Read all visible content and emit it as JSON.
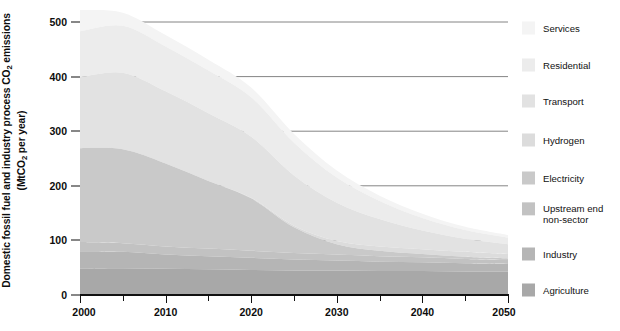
{
  "chart_data": {
    "type": "area",
    "stacked": true,
    "title": "",
    "xlabel": "",
    "ylabel": "Domestic fossil fuel and industry process CO2 emissions (MtCO2 per year)",
    "ylabel_line1": "Domestic fossil fuel and industry process CO",
    "ylabel_line1_sub": "2",
    "ylabel_line1_tail": " emissions",
    "ylabel_line2_head": "(MtCO",
    "ylabel_line2_sub": "2",
    "ylabel_line2_tail": " per year)",
    "xlim": [
      2000,
      2050
    ],
    "ylim": [
      0,
      500
    ],
    "yticks": [
      0,
      100,
      200,
      300,
      400,
      500
    ],
    "ytick_labels": [
      "0",
      "100",
      "200",
      "300",
      "400",
      "500"
    ],
    "xticks": [
      2000,
      2010,
      2020,
      2030,
      2040,
      2050
    ],
    "xtick_labels": [
      "2000",
      "2010",
      "2020",
      "2030",
      "2040",
      "2050"
    ],
    "xminor_ticks": [
      2005,
      2015,
      2025,
      2035,
      2045
    ],
    "grid": "horizontal-behind-area",
    "legend_position": "right",
    "x": [
      2000,
      2005,
      2010,
      2015,
      2020,
      2025,
      2030,
      2035,
      2040,
      2045,
      2050
    ],
    "series": [
      {
        "name": "Agriculture",
        "color": "#a8a8a8",
        "values": [
          48,
          49,
          48,
          47,
          46,
          45,
          45,
          44,
          44,
          43,
          43
        ]
      },
      {
        "name": "Industry",
        "color": "#b5b5b5",
        "values": [
          32,
          30,
          26,
          24,
          22,
          20,
          18,
          17,
          16,
          15,
          14
        ]
      },
      {
        "name": "Upstream end non-sector",
        "color": "#c2c2c2",
        "values": [
          17,
          16,
          15,
          14,
          13,
          12,
          11,
          10,
          9,
          8,
          7
        ]
      },
      {
        "name": "Electricity",
        "color": "#c9c9c9",
        "values": [
          172,
          172,
          152,
          124,
          96,
          47,
          19,
          10,
          6,
          4,
          3
        ]
      },
      {
        "name": "Hydrogen",
        "color": "#dcdcdc",
        "values": [
          0,
          0,
          0,
          0,
          1,
          3,
          6,
          8,
          9,
          9,
          8
        ]
      },
      {
        "name": "Transport",
        "color": "#e2e2e2",
        "values": [
          130,
          140,
          132,
          124,
          112,
          92,
          70,
          50,
          34,
          24,
          18
        ]
      },
      {
        "name": "Residential",
        "color": "#ececec",
        "values": [
          84,
          86,
          82,
          78,
          72,
          60,
          46,
          33,
          23,
          16,
          12
        ]
      },
      {
        "name": "Services",
        "color": "#f4f4f4",
        "values": [
          39,
          24,
          21,
          20,
          18,
          16,
          13,
          10,
          8,
          6,
          5
        ]
      }
    ],
    "totals": [
      522,
      517,
      476,
      431,
      380,
      295,
      228,
      182,
      149,
      125,
      110
    ]
  },
  "legend": {
    "items": [
      {
        "label": "Services",
        "color": "#f4f4f4",
        "y": 28
      },
      {
        "label": "Residential",
        "color": "#ececec",
        "y": 65
      },
      {
        "label": "Transport",
        "color": "#e2e2e2",
        "y": 101
      },
      {
        "label": "Hydrogen",
        "color": "#dcdcdc",
        "y": 140
      },
      {
        "label": "Electricity",
        "color": "#c9c9c9",
        "y": 178
      },
      {
        "label": "Upstream end\nnon-sector",
        "color": "#c2c2c2",
        "y": 214
      },
      {
        "label": "Industry",
        "color": "#b5b5b5",
        "y": 254
      },
      {
        "label": "Agriculture",
        "color": "#a8a8a8",
        "y": 290
      }
    ]
  },
  "axes": {
    "y_tick_values": [
      "500",
      "400",
      "300",
      "200",
      "100",
      "0"
    ],
    "x_tick_values": [
      "2000",
      "2010",
      "2020",
      "2030",
      "2040",
      "2050"
    ]
  }
}
